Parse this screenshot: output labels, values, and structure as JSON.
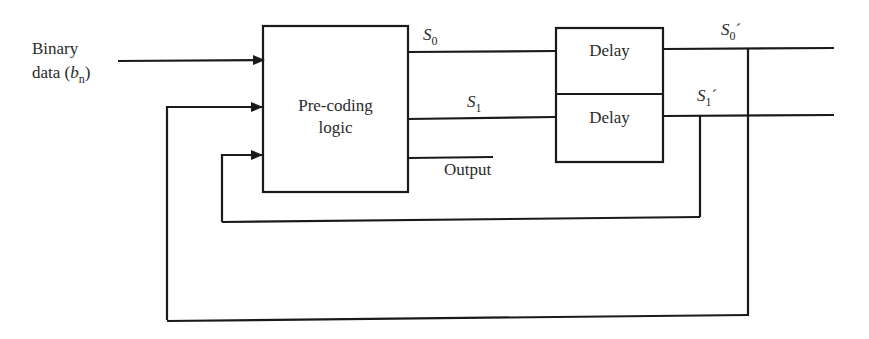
{
  "diagram": {
    "input_label_line1": "Binary",
    "input_label_line2": "data (",
    "input_var": "b",
    "input_var_sub": "n",
    "input_label_close": ")",
    "block_precoding_line1": "Pre-coding",
    "block_precoding_line2": "logic",
    "s0_label": "S",
    "s0_sub": "0",
    "s1_label": "S",
    "s1_sub": "1",
    "output_label": "Output",
    "delay_top_label": "Delay",
    "delay_bottom_label": "Delay",
    "s0p_label": "S",
    "s0p_sub": "0",
    "s0p_prime": "´",
    "s1p_label": "S",
    "s1p_sub": "1",
    "s1p_prime": "´",
    "line_color": "#1a1a1a"
  }
}
